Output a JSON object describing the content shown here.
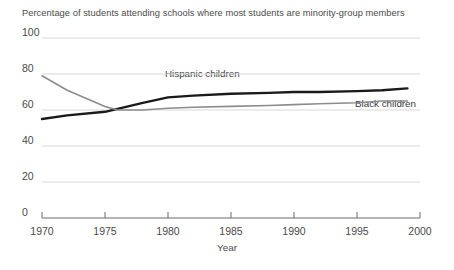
{
  "chart_data": {
    "type": "line",
    "title": "Percentage of students attending schools where most students are minority-group members",
    "xlabel": "Year",
    "ylabel": "",
    "xlim": [
      1970,
      2000
    ],
    "ylim": [
      0,
      100
    ],
    "grid": true,
    "legend_position": "inline-annotation",
    "xticks": [
      1970,
      1975,
      1980,
      1985,
      1990,
      1995,
      2000
    ],
    "yticks": [
      0,
      20,
      40,
      60,
      80,
      100
    ],
    "series": [
      {
        "name": "Hispanic children",
        "color": "#1a1a1a",
        "x": [
          1970,
          1972,
          1975,
          1978,
          1980,
          1982,
          1985,
          1988,
          1990,
          1992,
          1995,
          1997,
          1999
        ],
        "values": [
          55,
          57,
          59,
          64,
          67,
          68,
          69,
          69.5,
          70,
          70,
          70.5,
          71,
          72
        ]
      },
      {
        "name": "Black children",
        "color": "#8c8c8c",
        "x": [
          1970,
          1972,
          1975,
          1976,
          1978,
          1980,
          1982,
          1985,
          1988,
          1990,
          1992,
          1995,
          1997,
          1999
        ],
        "values": [
          79,
          71,
          62,
          60,
          60,
          61,
          61.5,
          62,
          62.5,
          63,
          63.5,
          64,
          65,
          65
        ]
      }
    ]
  },
  "axis": {
    "x_label_text": "Year",
    "ytick_labels": [
      "100",
      "80",
      "60",
      "40",
      "20",
      "0"
    ],
    "xtick_labels": [
      "1970",
      "1975",
      "1980",
      "1985",
      "1990",
      "1995",
      "2000"
    ]
  },
  "annotations": {
    "hispanic_label": "Hispanic children",
    "black_label": "Black children"
  }
}
